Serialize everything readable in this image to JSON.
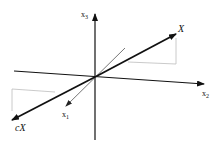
{
  "diagram": {
    "type": "3d-coordinate-vector",
    "axes": [
      {
        "id": "x1",
        "label": "x",
        "subscript": "1"
      },
      {
        "id": "x2",
        "label": "x",
        "subscript": "2"
      },
      {
        "id": "x3",
        "label": "x",
        "subscript": "3"
      }
    ],
    "vectors": [
      {
        "id": "X",
        "label": "X"
      },
      {
        "id": "cX",
        "label": "cX"
      }
    ],
    "colors": {
      "axis": "#111111",
      "vector": "#111111",
      "x1_axis": "#555555",
      "projection": "#bbbbbb"
    }
  }
}
